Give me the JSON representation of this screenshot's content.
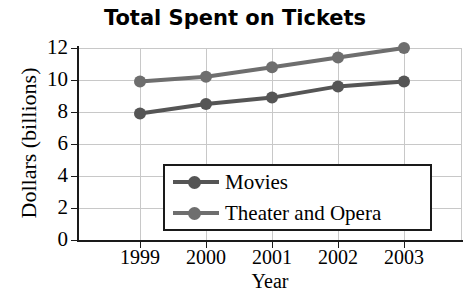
{
  "chart_data": {
    "type": "line",
    "title": "Total Spent on Tickets",
    "xlabel": "Year",
    "ylabel": "Dollars (billions)",
    "categories": [
      "1999",
      "2000",
      "2001",
      "2002",
      "2003"
    ],
    "x_tick_labels": [
      "1999",
      "2000",
      "2001",
      "2002",
      "2003"
    ],
    "y_tick_labels": [
      "0",
      "2",
      "4",
      "6",
      "8",
      "10",
      "12"
    ],
    "y_ticks": [
      0,
      2,
      4,
      6,
      8,
      10,
      12
    ],
    "ylim": [
      0,
      12
    ],
    "grid": true,
    "legend_position": "inside-lower-center",
    "series": [
      {
        "name": "Movies",
        "color": "#555555",
        "marker": "circle",
        "values": [
          7.9,
          8.5,
          8.9,
          9.6,
          9.9
        ]
      },
      {
        "name": "Theater and Opera",
        "color": "#6e6e6e",
        "marker": "circle",
        "values": [
          9.9,
          10.2,
          10.8,
          11.4,
          12.0
        ]
      }
    ]
  },
  "colors": {
    "axis": "#1a1a1a",
    "grid": "#c8c8c8",
    "background": "#ffffff",
    "series_movies": "#555555",
    "series_theater": "#6e6e6e"
  },
  "legend": {
    "items": [
      {
        "label": "Movies",
        "color": "#555555"
      },
      {
        "label": "Theater and Opera",
        "color": "#6e6e6e"
      }
    ]
  }
}
